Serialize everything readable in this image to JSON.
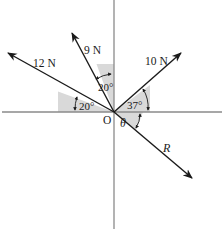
{
  "diagram": {
    "origin_label": "O",
    "forces": [
      {
        "id": "force-12n",
        "label": "12 N",
        "angle_deg": 160,
        "reference": "20° above negative x-axis"
      },
      {
        "id": "force-9n",
        "label": "9 N",
        "angle_deg": 110,
        "reference": "20° from positive y-axis toward negative x"
      },
      {
        "id": "force-10n",
        "label": "10 N",
        "angle_deg": 37,
        "reference": "37° above positive x-axis"
      },
      {
        "id": "resultant",
        "label": "R",
        "angle_symbol": "θ",
        "reference": "θ below positive x-axis"
      }
    ],
    "angles": {
      "a12": "20°",
      "a9": "20°",
      "a10": "37°",
      "theta": "θ"
    },
    "colors": {
      "axis": "#8a8a8a",
      "vector": "#1a1a1a",
      "shade": "#d9d9d9"
    }
  }
}
